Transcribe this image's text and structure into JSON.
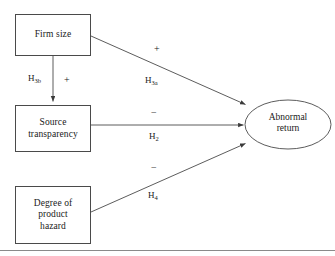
{
  "figure": {
    "type": "conceptual-path-diagram",
    "background_color": "#ffffff",
    "stroke_color": "#4a4a4a",
    "text_color": "#1a1a1a",
    "bottom_rule_color": "#8a8a8a"
  },
  "nodes": [
    {
      "id": "firm-size",
      "label": "Firm size",
      "shape": "rectangle",
      "x": 15,
      "y": 14,
      "w": 76,
      "h": 42
    },
    {
      "id": "source-transparency",
      "label": "Source\ntransparency",
      "shape": "rectangle",
      "x": 15,
      "y": 105,
      "w": 76,
      "h": 47
    },
    {
      "id": "degree-of-product-hazard",
      "label": "Degree of\nproduct\nhazard",
      "shape": "rectangle",
      "x": 15,
      "y": 186,
      "w": 76,
      "h": 58
    },
    {
      "id": "abnormal-return",
      "label": "Abnormal\nreturn",
      "shape": "ellipse",
      "x": 245,
      "y": 100,
      "w": 86,
      "h": 49
    }
  ],
  "edges": [
    {
      "id": "h3a",
      "from": "firm-size",
      "to": "abnormal-return",
      "hypothesis": "H3a",
      "hypothesis_base": "H",
      "hypothesis_sub": "3a",
      "sign": "+",
      "x1": 91,
      "y1": 36,
      "x2": 247,
      "y2": 105
    },
    {
      "id": "h3b",
      "from": "firm-size",
      "to": "source-transparency",
      "hypothesis": "H3b",
      "hypothesis_base": "H",
      "hypothesis_sub": "3b",
      "sign": "+",
      "x1": 53,
      "y1": 56,
      "x2": 53,
      "y2": 104
    },
    {
      "id": "h2",
      "from": "source-transparency",
      "to": "abnormal-return",
      "hypothesis": "H2",
      "hypothesis_base": "H",
      "hypothesis_sub": "2",
      "sign": "−",
      "x1": 91,
      "y1": 125,
      "x2": 245,
      "y2": 125
    },
    {
      "id": "h4",
      "from": "degree-of-product-hazard",
      "to": "abnormal-return",
      "hypothesis": "H4",
      "hypothesis_base": "H",
      "hypothesis_sub": "4",
      "sign": "−",
      "x1": 91,
      "y1": 212,
      "x2": 247,
      "y2": 143
    }
  ],
  "labels": {
    "h3a_text": "H",
    "h3a_sub": "3a",
    "h3a_sign": "+",
    "h3b_text": "H",
    "h3b_sub": "3b",
    "h3b_sign": "+",
    "h2_text": "H",
    "h2_sub": "2",
    "h2_sign": "−",
    "h4_text": "H",
    "h4_sub": "4",
    "h4_sign": "−"
  }
}
